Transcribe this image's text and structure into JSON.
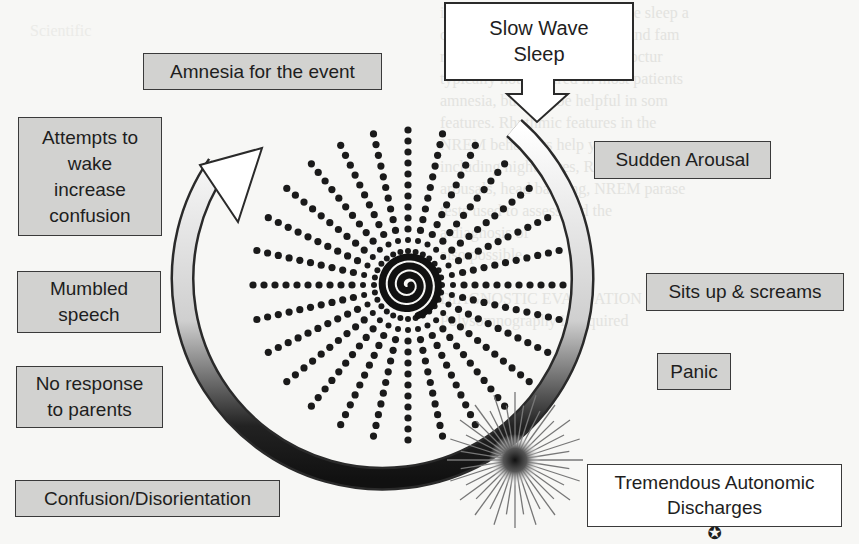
{
  "diagram": {
    "start_node": {
      "label": "Slow Wave\nSleep",
      "style": "white-arrow-box"
    },
    "right_side": [
      {
        "id": "sudden-arousal",
        "label": "Sudden Arousal"
      },
      {
        "id": "sits-up",
        "label": "Sits up & screams"
      },
      {
        "id": "panic",
        "label": "Panic"
      }
    ],
    "peak_node": {
      "label": "Tremendous Autonomic\nDischarges",
      "icon": "star-circle-icon",
      "icon_glyph": "✪"
    },
    "left_side": [
      {
        "id": "confusion",
        "label": "Confusion/Disorientation"
      },
      {
        "id": "no-response",
        "label": "No response\nto parents"
      },
      {
        "id": "mumbled",
        "label": "Mumbled\nspeech"
      },
      {
        "id": "attempts",
        "label": "Attempts to\nwake\nincrease\nconfusion"
      },
      {
        "id": "amnesia",
        "label": "Amnesia for the event"
      }
    ],
    "colors": {
      "box_fill": "#d2d2d0",
      "box_border": "#3a3a3a",
      "dots": "#1a1a1a",
      "background": "#f7f7f5"
    }
  },
  "background_bleed": {
    "lines": [
      "including comorbid obstructive sleep a",
      "dementia, disorders of sleep, and fam",
      "review of nocturnal events. Noctur",
      "typically not required in most patients",
      "amnesia, but may be helpful in som",
      "features. Rhythmic features in the",
      "NREM behaviors help you to",
      "including nightmares, REM",
      "arousals, head banging, NREM parase",
      "tests used to assess and the",
      "a diagnosis of",
      "also possible",
      "DIAGNOSTIC EVALUATION OF BED",
      "Polysomnography is required"
    ],
    "left_lines": [
      "Scientific",
      "CLINICAL FEATURES",
      "is a parasomnia that is a hallmark",
      "occurs in childhood, during the",
      "sleep. Unlike first part of the",
      "period. The child typically",
      "arousals. Nocturnal enuresis",
      "and is associated with",
      "hypnotic, sedatives, and",
      "can be and may confuse",
      "are frequent. In most patients",
      "injury sustained to self or",
      "of the event documented",
      "unusual or episode"
    ]
  }
}
